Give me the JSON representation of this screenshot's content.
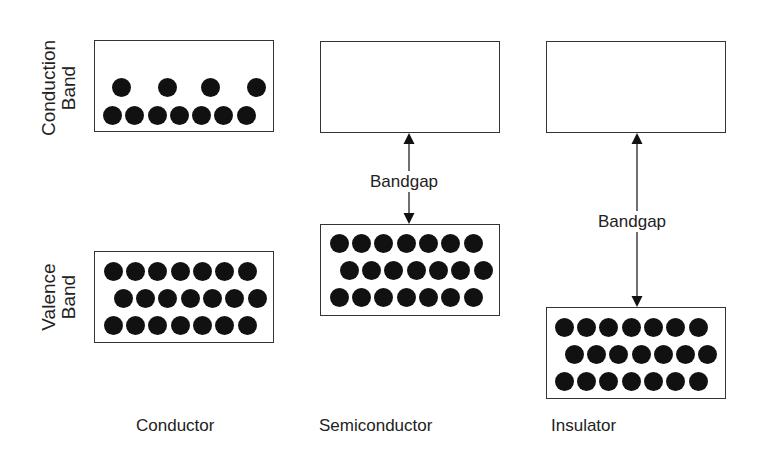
{
  "diagram": {
    "row_labels": {
      "conduction": [
        "Conduction",
        "Band"
      ],
      "valence": [
        "Valence",
        "Band"
      ]
    },
    "columns": [
      {
        "name": "Conductor",
        "conduction_band": {
          "electrons_top_row": 4,
          "electrons_bottom_row": 7
        },
        "valence_band": {
          "rows": [
            7,
            7,
            7
          ]
        },
        "bandgap_label": null,
        "overlap": true
      },
      {
        "name": "Semiconductor",
        "conduction_band": {
          "electrons_top_row": 0,
          "electrons_bottom_row": 0
        },
        "valence_band": {
          "rows": [
            7,
            7,
            7
          ]
        },
        "bandgap_label": "Bandgap",
        "bandgap_size": "small"
      },
      {
        "name": "Insulator",
        "conduction_band": {
          "electrons_top_row": 0,
          "electrons_bottom_row": 0
        },
        "valence_band": {
          "rows": [
            7,
            7,
            7
          ]
        },
        "bandgap_label": "Bandgap",
        "bandgap_size": "large"
      }
    ],
    "colors": {
      "stroke": "#333333",
      "electron": "#111111",
      "background": "#ffffff"
    }
  }
}
